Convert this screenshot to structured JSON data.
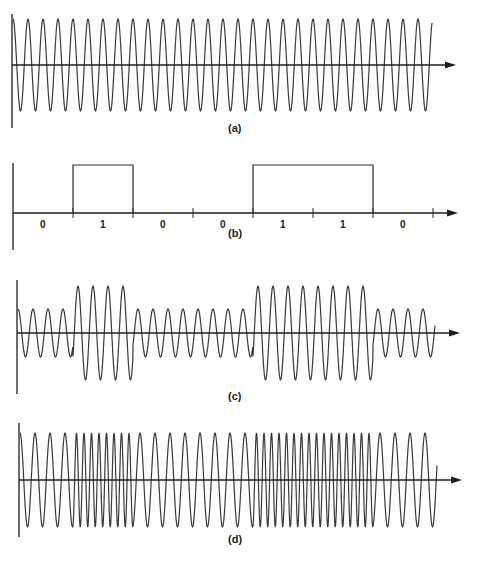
{
  "figure": {
    "background": "#ffffff",
    "ink_color": "#2a2a2a",
    "panels": [
      {
        "id": "a",
        "label": "(a)",
        "type": "carrier",
        "axis_y": 65,
        "x_start": 13,
        "x_end": 432,
        "arrow_x": 456,
        "vaxis_top": 14,
        "vaxis_bottom": 128,
        "amplitude": 46,
        "period": 15,
        "label_x": 228,
        "label_y": 132
      },
      {
        "id": "b",
        "label": "(b)",
        "type": "digital",
        "axis_y": 213,
        "x_start": 13,
        "arrow_x": 458,
        "vaxis_top": 163,
        "vaxis_bottom": 250,
        "high_y": 165,
        "bit_width": 60,
        "bit_origin": 13,
        "bits": [
          0,
          1,
          0,
          0,
          1,
          1,
          0
        ],
        "bit_labels": [
          "0",
          "1",
          "0",
          "0",
          "1",
          "1",
          "0"
        ],
        "label_x": 228,
        "label_y": 237
      },
      {
        "id": "c",
        "label": "(c)",
        "type": "ask",
        "axis_y": 333,
        "x_start": 18,
        "x_end": 435,
        "arrow_x": 460,
        "vaxis_top": 280,
        "vaxis_bottom": 394,
        "amplitude_low": 24,
        "amplitude_high": 47,
        "period": 15,
        "bit_width": 60,
        "bit_origin": 13,
        "bits": [
          0,
          1,
          0,
          0,
          1,
          1,
          0
        ],
        "label_x": 228,
        "label_y": 400
      },
      {
        "id": "d",
        "label": "(d)",
        "type": "fsk",
        "axis_y": 480,
        "x_start": 20,
        "x_end": 437,
        "arrow_x": 462,
        "vaxis_top": 423,
        "vaxis_bottom": 537,
        "amplitude": 47,
        "period_low": 15,
        "period_high": 7.5,
        "bit_width": 60,
        "bit_origin": 13,
        "bits": [
          0,
          1,
          0,
          0,
          1,
          1,
          0
        ],
        "label_x": 228,
        "label_y": 543
      }
    ]
  }
}
